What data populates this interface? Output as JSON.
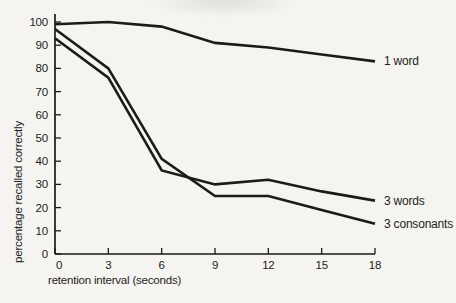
{
  "colors": {
    "background": "#f5f4f0",
    "ink": "#1b1b1b",
    "text": "#1d1d1d"
  },
  "chart_data": {
    "type": "line",
    "xlabel": "retention interval (seconds)",
    "ylabel": "percentage recalled correctly",
    "x": [
      0,
      3,
      6,
      9,
      12,
      15,
      18
    ],
    "x_tick_labels": [
      "0",
      "3",
      "6",
      "9",
      "12",
      "15",
      "18"
    ],
    "y_tick_labels": [
      "0",
      "10",
      "20",
      "30",
      "40",
      "50",
      "60",
      "70",
      "80",
      "90",
      "100"
    ],
    "xlim": [
      0,
      18
    ],
    "ylim": [
      0,
      100
    ],
    "grid": false,
    "legend": "labels-at-line-ends",
    "series": [
      {
        "name": "1 word",
        "values": [
          99,
          100,
          98,
          91,
          89,
          86,
          83
        ]
      },
      {
        "name": "3 words",
        "values": [
          93,
          76,
          36,
          30,
          32,
          27,
          23
        ]
      },
      {
        "name": "3 consonants",
        "values": [
          97,
          80,
          41,
          25,
          25,
          19,
          13
        ]
      }
    ]
  }
}
